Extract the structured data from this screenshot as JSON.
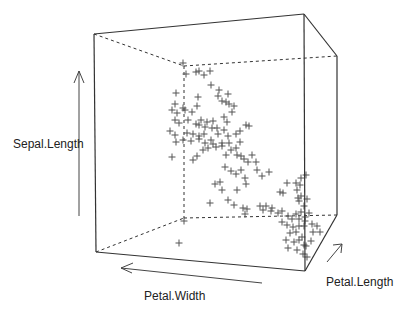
{
  "chart_data": {
    "type": "scatter",
    "subtype": "3d-scatter",
    "title": "",
    "axes": {
      "x": {
        "label": "Petal.Width"
      },
      "y": {
        "label": "Petal.Length"
      },
      "z": {
        "label": "Sepal.Length"
      }
    },
    "marker": "+",
    "marker_color": "#555555",
    "box": {
      "color": "#333333",
      "front_top_left": [
        94,
        34
      ],
      "front_top_right": [
        304,
        14
      ],
      "back_top_right": [
        337,
        56
      ],
      "back_top_inner": [
        184,
        66
      ],
      "front_bottom_left": [
        96,
        252
      ],
      "front_bottom_right": [
        305,
        271
      ],
      "back_bottom_right": [
        337,
        215
      ],
      "back_bottom_inner": [
        184,
        218
      ]
    },
    "projected_points_px": [
      [
        183,
        63
      ],
      [
        186,
        74
      ],
      [
        196,
        72
      ],
      [
        199,
        71
      ],
      [
        204,
        75
      ],
      [
        210,
        71
      ],
      [
        211,
        85
      ],
      [
        176,
        93
      ],
      [
        198,
        97
      ],
      [
        219,
        90
      ],
      [
        218,
        96
      ],
      [
        228,
        94
      ],
      [
        222,
        101
      ],
      [
        226,
        102
      ],
      [
        175,
        104
      ],
      [
        172,
        110
      ],
      [
        177,
        113
      ],
      [
        183,
        108
      ],
      [
        185,
        110
      ],
      [
        192,
        112
      ],
      [
        197,
        106
      ],
      [
        175,
        120
      ],
      [
        179,
        123
      ],
      [
        188,
        120
      ],
      [
        196,
        124
      ],
      [
        199,
        125
      ],
      [
        201,
        120
      ],
      [
        205,
        127
      ],
      [
        207,
        122
      ],
      [
        213,
        121
      ],
      [
        217,
        128
      ],
      [
        224,
        117
      ],
      [
        227,
        122
      ],
      [
        232,
        112
      ],
      [
        234,
        106
      ],
      [
        229,
        104
      ],
      [
        170,
        131
      ],
      [
        175,
        135
      ],
      [
        187,
        133
      ],
      [
        193,
        134
      ],
      [
        199,
        136
      ],
      [
        204,
        134
      ],
      [
        212,
        128
      ],
      [
        218,
        134
      ],
      [
        224,
        130
      ],
      [
        228,
        136
      ],
      [
        236,
        134
      ],
      [
        240,
        131
      ],
      [
        246,
        125
      ],
      [
        249,
        126
      ],
      [
        176,
        142
      ],
      [
        183,
        140
      ],
      [
        191,
        141
      ],
      [
        199,
        139
      ],
      [
        205,
        143
      ],
      [
        211,
        140
      ],
      [
        216,
        147
      ],
      [
        222,
        143
      ],
      [
        229,
        143
      ],
      [
        236,
        148
      ],
      [
        240,
        142
      ],
      [
        172,
        157
      ],
      [
        193,
        160
      ],
      [
        197,
        156
      ],
      [
        203,
        150
      ],
      [
        208,
        148
      ],
      [
        213,
        144
      ],
      [
        222,
        146
      ],
      [
        226,
        155
      ],
      [
        231,
        150
      ],
      [
        237,
        155
      ],
      [
        241,
        156
      ],
      [
        244,
        159
      ],
      [
        248,
        162
      ],
      [
        252,
        155
      ],
      [
        256,
        162
      ],
      [
        257,
        170
      ],
      [
        262,
        176
      ],
      [
        269,
        172
      ],
      [
        225,
        167
      ],
      [
        231,
        171
      ],
      [
        236,
        174
      ],
      [
        241,
        170
      ],
      [
        245,
        178
      ],
      [
        220,
        182
      ],
      [
        222,
        190
      ],
      [
        246,
        184
      ],
      [
        237,
        190
      ],
      [
        210,
        203
      ],
      [
        228,
        200
      ],
      [
        234,
        205
      ],
      [
        243,
        208
      ],
      [
        245,
        214
      ],
      [
        247,
        209
      ],
      [
        266,
        206
      ],
      [
        272,
        208
      ],
      [
        280,
        192
      ],
      [
        283,
        193
      ],
      [
        297,
        190
      ],
      [
        300,
        185
      ],
      [
        298,
        198
      ],
      [
        301,
        196
      ],
      [
        299,
        201
      ],
      [
        304,
        206
      ],
      [
        307,
        199
      ],
      [
        301,
        212
      ],
      [
        305,
        217
      ],
      [
        309,
        213
      ],
      [
        305,
        221
      ],
      [
        299,
        226
      ],
      [
        296,
        232
      ],
      [
        299,
        240
      ],
      [
        302,
        237
      ],
      [
        304,
        245
      ],
      [
        306,
        246
      ],
      [
        311,
        241
      ],
      [
        307,
        257
      ],
      [
        303,
        254
      ],
      [
        271,
        211
      ],
      [
        278,
        213
      ],
      [
        282,
        211
      ],
      [
        288,
        216
      ],
      [
        292,
        219
      ],
      [
        282,
        222
      ],
      [
        287,
        225
      ],
      [
        293,
        227
      ],
      [
        296,
        214
      ],
      [
        299,
        219
      ],
      [
        304,
        226
      ],
      [
        312,
        224
      ],
      [
        317,
        226
      ],
      [
        320,
        232
      ],
      [
        313,
        232
      ],
      [
        290,
        233
      ],
      [
        286,
        240
      ],
      [
        294,
        242
      ],
      [
        288,
        248
      ],
      [
        297,
        250
      ],
      [
        260,
        206
      ],
      [
        263,
        210
      ],
      [
        215,
        184
      ],
      [
        179,
        243
      ],
      [
        184,
        221
      ],
      [
        287,
        183
      ],
      [
        296,
        183
      ],
      [
        301,
        178
      ],
      [
        306,
        175
      ]
    ]
  },
  "labels": {
    "z_axis": "Sepal.Length",
    "x_axis": "Petal.Width",
    "y_axis": "Petal.Length"
  }
}
